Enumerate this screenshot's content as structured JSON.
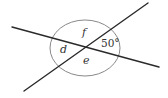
{
  "diagram": {
    "colors": {
      "line": "#2a2a2a",
      "circle": "#7a7a7a",
      "text": "#333333",
      "background": "#ffffff"
    },
    "lines": [
      {
        "name": "line-1",
        "x1": 12,
        "y1": 27,
        "x2": 159,
        "y2": 67
      },
      {
        "name": "line-2",
        "x1": 24,
        "y1": 91,
        "x2": 148,
        "y2": 3
      }
    ],
    "intersection": {
      "x": 85,
      "y": 47
    },
    "circle": {
      "cx": 85,
      "cy": 48,
      "rx": 35,
      "ry": 28
    },
    "angles": [
      {
        "id": "f",
        "label": "f",
        "x": 82,
        "y": 36,
        "italic": true
      },
      {
        "id": "d",
        "label": "d",
        "x": 60,
        "y": 53,
        "italic": true
      },
      {
        "id": "e",
        "label": "e",
        "x": 83,
        "y": 64,
        "italic": true
      },
      {
        "id": "given",
        "label": "50°",
        "x": 101,
        "y": 47,
        "italic": false
      }
    ]
  }
}
